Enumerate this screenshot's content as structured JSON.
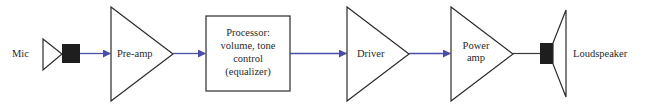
{
  "diagram": {
    "colors": {
      "outline": "#2b2b2b",
      "signal_arrow": "#4a4ea8",
      "fill_dark": "#1e1e1e",
      "background": "#ffffff"
    },
    "blocks": [
      {
        "id": "mic",
        "label": "Mic",
        "shape": "microphone"
      },
      {
        "id": "preamp",
        "label": "Pre-amp",
        "shape": "triangle"
      },
      {
        "id": "processor",
        "label_lines": [
          "Processor:",
          "volume, tone",
          "control",
          "(equalizer)"
        ],
        "shape": "rectangle"
      },
      {
        "id": "driver",
        "label": "Driver",
        "shape": "triangle"
      },
      {
        "id": "power_amp",
        "label_lines": [
          "Power",
          "amp"
        ],
        "shape": "triangle"
      },
      {
        "id": "loudspeaker",
        "label": "Loudspeaker",
        "shape": "speaker"
      }
    ],
    "edges": [
      {
        "from": "mic",
        "to": "preamp",
        "arrow": true
      },
      {
        "from": "preamp",
        "to": "processor",
        "arrow": true
      },
      {
        "from": "processor",
        "to": "driver",
        "arrow": true
      },
      {
        "from": "driver",
        "to": "power_amp",
        "arrow": true
      },
      {
        "from": "power_amp",
        "to": "loudspeaker",
        "arrow": false
      }
    ]
  }
}
